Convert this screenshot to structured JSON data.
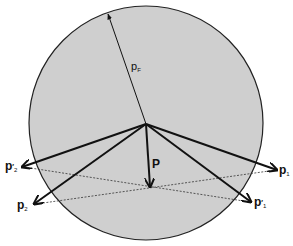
{
  "diagram": {
    "type": "momentum-space vector diagram (Fermi sphere)",
    "circle": {
      "fill": "#cfcfcf",
      "stroke": "#222222",
      "cx": 146,
      "cy": 123,
      "r": 117
    },
    "radius_vector": {
      "label": "p",
      "subscript": "F",
      "from": [
        146,
        124
      ],
      "to": [
        108,
        14
      ]
    },
    "origin": [
      146,
      124
    ],
    "vectors": [
      {
        "id": "p1",
        "label": "p",
        "prime": "",
        "subscript": "1",
        "to": [
          277,
          170
        ]
      },
      {
        "id": "p1p",
        "label": "p",
        "prime": "′",
        "subscript": "1",
        "to": [
          251,
          202
        ]
      },
      {
        "id": "p2",
        "label": "p",
        "prime": "",
        "subscript": "2",
        "to": [
          34,
          204
        ]
      },
      {
        "id": "p2p",
        "label": "p",
        "prime": "′",
        "subscript": "2",
        "to": [
          22,
          167
        ]
      },
      {
        "id": "P",
        "label": "P",
        "prime": "",
        "subscript": "",
        "to": [
          150,
          187
        ]
      }
    ],
    "dashed_lines": [
      {
        "from": [
          22,
          167
        ],
        "to": [
          251,
          202
        ]
      },
      {
        "from": [
          34,
          204
        ],
        "to": [
          277,
          170
        ]
      }
    ],
    "labels": {
      "pF": {
        "main": "p",
        "sub": "F"
      },
      "P": {
        "main": "P"
      },
      "p1": {
        "main": "p",
        "sub": "1"
      },
      "p1_prime": {
        "main": "p",
        "prime": "′",
        "sub": "1"
      },
      "p2": {
        "main": "p",
        "sub": "2"
      },
      "p2_prime": {
        "main": "p",
        "prime": "′",
        "sub": "2"
      }
    }
  }
}
